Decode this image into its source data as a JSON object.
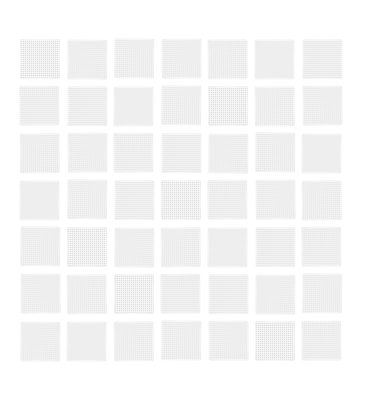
{
  "image": {
    "title": "Grid of light gray textured squares",
    "kind": "scanned-pattern",
    "width": 369,
    "height": 406
  },
  "canvas": {
    "background_color": "#ffffff"
  },
  "pattern": {
    "name": "square-lattice",
    "rows": 7,
    "columns": 7,
    "cell_count": 49,
    "square_color": "#e2e2e2",
    "gap_color": "#ffffff",
    "cell_width": 40,
    "cell_height": 40,
    "gap_x": 7,
    "gap_y": 7,
    "offset_left": 20,
    "offset_top": 39,
    "grid_width": 322,
    "grid_height": 322,
    "texture": "fine woven halftone noise",
    "edge_style": "irregular soft scanned edges"
  },
  "cells": [
    {
      "row": 1,
      "col": 1,
      "label": "square-r1c1",
      "jitter": 0
    },
    {
      "row": 1,
      "col": 2,
      "label": "square-r1c2",
      "jitter": 3
    },
    {
      "row": 1,
      "col": 3,
      "label": "square-r1c3",
      "jitter": 5
    },
    {
      "row": 1,
      "col": 4,
      "label": "square-r1c4",
      "jitter": 1
    },
    {
      "row": 1,
      "col": 5,
      "label": "square-r1c5",
      "jitter": 6
    },
    {
      "row": 1,
      "col": 6,
      "label": "square-r1c6",
      "jitter": 2
    },
    {
      "row": 1,
      "col": 7,
      "label": "square-r1c7",
      "jitter": 7
    },
    {
      "row": 2,
      "col": 1,
      "label": "square-r2c1",
      "jitter": 4
    },
    {
      "row": 2,
      "col": 2,
      "label": "square-r2c2",
      "jitter": 7
    },
    {
      "row": 2,
      "col": 3,
      "label": "square-r2c3",
      "jitter": 2
    },
    {
      "row": 2,
      "col": 4,
      "label": "square-r2c4",
      "jitter": 5
    },
    {
      "row": 2,
      "col": 5,
      "label": "square-r2c5",
      "jitter": 0
    },
    {
      "row": 2,
      "col": 6,
      "label": "square-r2c6",
      "jitter": 6
    },
    {
      "row": 2,
      "col": 7,
      "label": "square-r2c7",
      "jitter": 1
    },
    {
      "row": 3,
      "col": 1,
      "label": "square-r3c1",
      "jitter": 6
    },
    {
      "row": 3,
      "col": 2,
      "label": "square-r3c2",
      "jitter": 1
    },
    {
      "row": 3,
      "col": 3,
      "label": "square-r3c3",
      "jitter": 4
    },
    {
      "row": 3,
      "col": 4,
      "label": "square-r3c4",
      "jitter": 7
    },
    {
      "row": 3,
      "col": 5,
      "label": "square-r3c5",
      "jitter": 3
    },
    {
      "row": 3,
      "col": 6,
      "label": "square-r3c6",
      "jitter": 5
    },
    {
      "row": 3,
      "col": 7,
      "label": "square-r3c7",
      "jitter": 2
    },
    {
      "row": 4,
      "col": 1,
      "label": "square-r4c1",
      "jitter": 2
    },
    {
      "row": 4,
      "col": 2,
      "label": "square-r4c2",
      "jitter": 5
    },
    {
      "row": 4,
      "col": 3,
      "label": "square-r4c3",
      "jitter": 7
    },
    {
      "row": 4,
      "col": 4,
      "label": "square-r4c4",
      "jitter": 0
    },
    {
      "row": 4,
      "col": 5,
      "label": "square-r4c5",
      "jitter": 4
    },
    {
      "row": 4,
      "col": 6,
      "label": "square-r4c6",
      "jitter": 1
    },
    {
      "row": 4,
      "col": 7,
      "label": "square-r4c7",
      "jitter": 6
    },
    {
      "row": 5,
      "col": 1,
      "label": "square-r5c1",
      "jitter": 5
    },
    {
      "row": 5,
      "col": 2,
      "label": "square-r5c2",
      "jitter": 0
    },
    {
      "row": 5,
      "col": 3,
      "label": "square-r5c3",
      "jitter": 3
    },
    {
      "row": 5,
      "col": 4,
      "label": "square-r5c4",
      "jitter": 6
    },
    {
      "row": 5,
      "col": 5,
      "label": "square-r5c5",
      "jitter": 2
    },
    {
      "row": 5,
      "col": 6,
      "label": "square-r5c6",
      "jitter": 7
    },
    {
      "row": 5,
      "col": 7,
      "label": "square-r5c7",
      "jitter": 4
    },
    {
      "row": 6,
      "col": 1,
      "label": "square-r6c1",
      "jitter": 1
    },
    {
      "row": 6,
      "col": 2,
      "label": "square-r6c2",
      "jitter": 6
    },
    {
      "row": 6,
      "col": 3,
      "label": "square-r6c3",
      "jitter": 0
    },
    {
      "row": 6,
      "col": 4,
      "label": "square-r6c4",
      "jitter": 4
    },
    {
      "row": 6,
      "col": 5,
      "label": "square-r6c5",
      "jitter": 7
    },
    {
      "row": 6,
      "col": 6,
      "label": "square-r6c6",
      "jitter": 3
    },
    {
      "row": 6,
      "col": 7,
      "label": "square-r6c7",
      "jitter": 5
    },
    {
      "row": 7,
      "col": 1,
      "label": "square-r7c1",
      "jitter": 3
    },
    {
      "row": 7,
      "col": 2,
      "label": "square-r7c2",
      "jitter": 2
    },
    {
      "row": 7,
      "col": 3,
      "label": "square-r7c3",
      "jitter": 6
    },
    {
      "row": 7,
      "col": 4,
      "label": "square-r7c4",
      "jitter": 5
    },
    {
      "row": 7,
      "col": 5,
      "label": "square-r7c5",
      "jitter": 1
    },
    {
      "row": 7,
      "col": 6,
      "label": "square-r7c6",
      "jitter": 0
    },
    {
      "row": 7,
      "col": 7,
      "label": "square-r7c7",
      "jitter": 4
    }
  ]
}
